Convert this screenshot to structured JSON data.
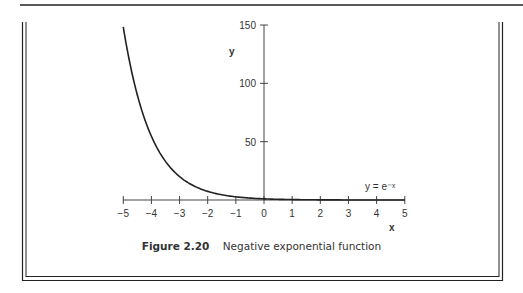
{
  "chart_data": {
    "type": "line",
    "title": "Negative exponential function",
    "figure_label": "Figure 2.20",
    "xlabel": "x",
    "ylabel": "y",
    "curve_label": "y = e⁻ˣ",
    "xlim": [
      -5,
      5
    ],
    "ylim": [
      0,
      150
    ],
    "x_ticks": [
      -5,
      -4,
      -3,
      -2,
      -1,
      0,
      1,
      2,
      3,
      4,
      5
    ],
    "x_tick_labels": [
      "−5",
      "−4",
      "−3",
      "−2",
      "−1",
      "0",
      "1",
      "2",
      "3",
      "4",
      "5"
    ],
    "y_ticks": [
      50,
      100,
      150
    ],
    "y_tick_labels": [
      "50",
      "100",
      "150"
    ],
    "grid": false,
    "series": [
      {
        "name": "y = e^-x",
        "x": [
          -5,
          -4.5,
          -4,
          -3.5,
          -3,
          -2.5,
          -2,
          -1.5,
          -1,
          -0.5,
          0,
          1,
          2,
          3,
          4,
          5
        ],
        "y": [
          148.4,
          90.0,
          54.6,
          33.1,
          20.1,
          12.2,
          7.39,
          4.48,
          2.72,
          1.65,
          1.0,
          0.37,
          0.14,
          0.05,
          0.02,
          0.007
        ]
      }
    ]
  },
  "caption": {
    "figure_number": "Figure 2.20",
    "text": "Negative exponential function"
  }
}
